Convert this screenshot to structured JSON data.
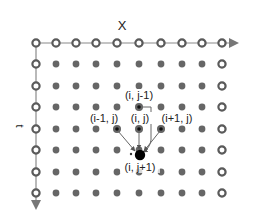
{
  "diagram": {
    "axes": {
      "x_label": "X",
      "t_label": "t"
    },
    "grid": {
      "columns": 10,
      "rows": 8,
      "col_x": [
        36,
        56,
        76,
        96,
        117,
        139,
        161,
        182,
        202,
        222
      ],
      "row_y": [
        43,
        64,
        86,
        107,
        129,
        150,
        172,
        193
      ],
      "boundary_node_style": "hollow-ring",
      "interior_node_style": "filled-gray-dot",
      "colors": {
        "boundary_ring": "#5a5a5a",
        "interior_dot": "#666666",
        "axis_line": "#8a8a8a",
        "highlight_core": "#111111",
        "target_node": "#000000",
        "arrow": "#555555",
        "label_text": "#222222"
      }
    },
    "stencil": {
      "nodes": [
        {
          "id": "i_jm1",
          "label": "(i, j-1)",
          "col": 5,
          "row": 3
        },
        {
          "id": "im1_j",
          "label": "(i-1, j)",
          "col": 4,
          "row": 4
        },
        {
          "id": "i_j",
          "label": "(i, j)",
          "col": 5,
          "row": 4
        },
        {
          "id": "ip1_j",
          "label": "(i+1, j)",
          "col": 6,
          "row": 4
        }
      ],
      "target": {
        "id": "i_jp1",
        "label": "(i, j+1)",
        "x": 140,
        "y": 155
      }
    }
  }
}
